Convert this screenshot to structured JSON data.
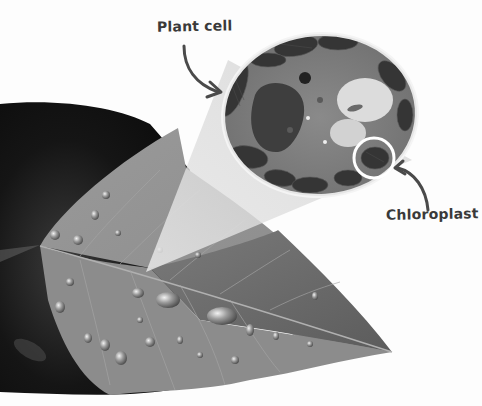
{
  "figure": {
    "type": "illustration",
    "color_scheme": "grayscale"
  },
  "labels": {
    "plant_cell": "Plant cell",
    "chloroplast": "Chloroplast"
  },
  "elements": {
    "background": "dark-blurred-foliage",
    "leaf": "leaf-with-water-droplets",
    "magnifier_beam": "translucent-zoom-triangle",
    "cell_micrograph": "oval-plant-cell-micrograph",
    "highlight_circle": "white-circle-around-chloroplast"
  },
  "colors": {
    "label_text": "#3a3a3a",
    "arrow": "#4a4a4a",
    "background": "#fdfdfd",
    "leaf_light": "#8e8e8e",
    "leaf_dark": "#6a6a6a",
    "foliage_dark": "#1a1a1a"
  }
}
